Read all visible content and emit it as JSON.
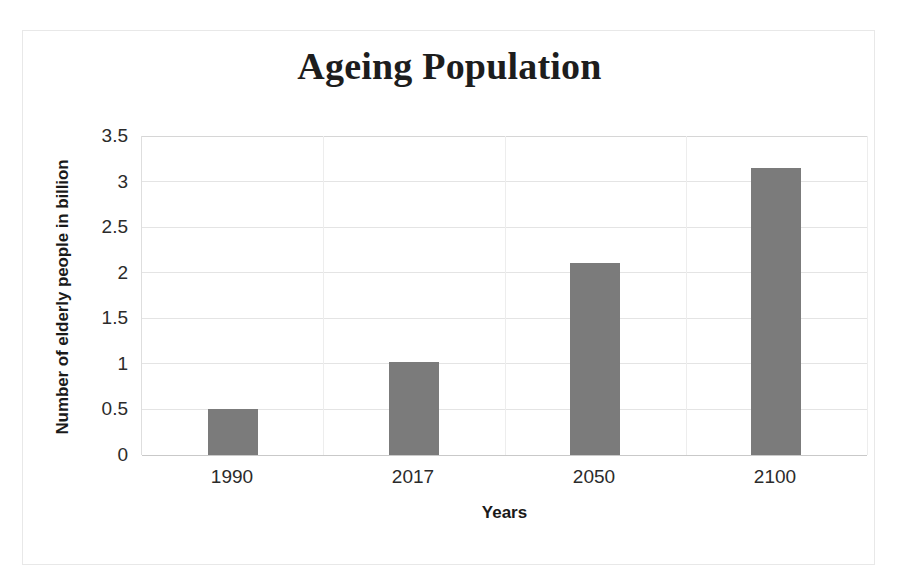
{
  "chart_data": {
    "type": "bar",
    "title": "Ageing Population",
    "xlabel": "Years",
    "ylabel": "Number of elderly people in billion",
    "categories": [
      "1990",
      "2017",
      "2050",
      "2100"
    ],
    "values": [
      0.51,
      1.02,
      2.11,
      3.15
    ],
    "series": [
      {
        "name": "Number of elderly people in billion",
        "values": [
          0.51,
          1.02,
          2.11,
          3.15
        ]
      }
    ],
    "ylim": [
      0,
      3.5
    ],
    "ytick_labels": [
      "0",
      "0.5",
      "1",
      "1.5",
      "2",
      "2.5",
      "3",
      "3.5"
    ],
    "ytick_values": [
      0,
      0.5,
      1,
      1.5,
      2,
      2.5,
      3,
      3.5
    ],
    "xtick_labels": [
      "1990",
      "2017",
      "2050",
      "2100"
    ],
    "grid": "horizontal",
    "legend": "none",
    "bar_color": "#7b7b7b",
    "grid_color": "#e4e4e4",
    "text_color": "#1d1d1d",
    "background_color": "#ffffff"
  }
}
